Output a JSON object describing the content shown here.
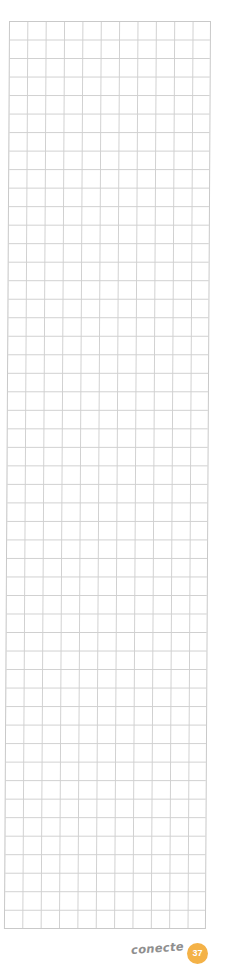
{
  "page": {
    "grid": {
      "columns": 11,
      "rows": 49,
      "line_color": "#d0d0d0"
    },
    "footer": {
      "brand_logo": "conecte",
      "page_number": "37",
      "badge_color": "#f4b247"
    }
  }
}
